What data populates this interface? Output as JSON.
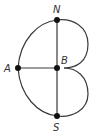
{
  "diagram": {
    "type": "graph",
    "nodes": [
      {
        "id": "N",
        "label": "N",
        "x": 57,
        "y": 20
      },
      {
        "id": "A",
        "label": "A",
        "x": 18,
        "y": 68
      },
      {
        "id": "B",
        "label": "B",
        "x": 57,
        "y": 68
      },
      {
        "id": "S",
        "label": "S",
        "x": 57,
        "y": 116
      }
    ],
    "edges": [
      {
        "from": "N",
        "to": "B",
        "shape": "straight"
      },
      {
        "from": "B",
        "to": "S",
        "shape": "straight"
      },
      {
        "from": "A",
        "to": "B",
        "shape": "straight"
      },
      {
        "from": "A",
        "to": "N",
        "shape": "curved"
      },
      {
        "from": "A",
        "to": "S",
        "shape": "curved"
      },
      {
        "from": "N",
        "to": "B",
        "shape": "curved-right"
      },
      {
        "from": "B",
        "to": "S",
        "shape": "curved-right"
      }
    ],
    "colors": {
      "edge": "#3a3a3a",
      "node": "#111111",
      "label": "#333333"
    }
  }
}
